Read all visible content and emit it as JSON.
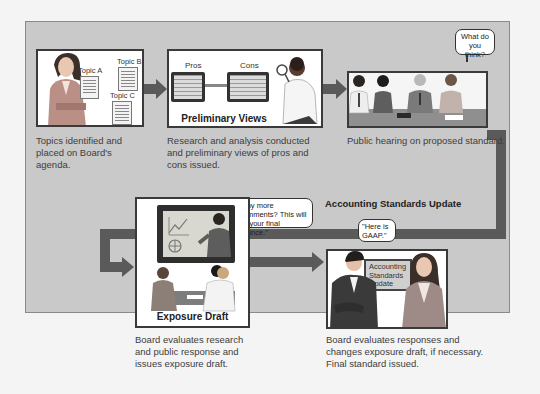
{
  "diagram": {
    "type": "process-flow",
    "steps": [
      {
        "id": 1,
        "caption": "Topics identified and placed on Board's agenda.",
        "image_labels": [
          "Topic A",
          "Topic B",
          "Topic C"
        ]
      },
      {
        "id": 2,
        "caption": "Research and analysis conducted and preliminary views of pros and cons issued.",
        "image_title": "Preliminary Views",
        "image_labels": [
          "Pros",
          "Cons"
        ]
      },
      {
        "id": 3,
        "caption": "Public hearing on proposed standard.",
        "speech": "What do you think?"
      },
      {
        "id": 4,
        "caption": "Board evaluates research and public response and issues exposure draft.",
        "image_title": "Exposure Draft",
        "speech": "\"Any more comments? This will be your final chance.\""
      },
      {
        "id": 5,
        "caption": "Board evaluates responses and changes exposure draft, if necessary. Final standard issued.",
        "heading": "Accounting Standards Update",
        "speech": "\"Here is GAAP.\"",
        "sign": "Accounting Standards Update"
      }
    ]
  },
  "colors": {
    "panel": "#c9c9c9",
    "arrow": "#5a5a5a",
    "box_border": "#3a3a3a"
  }
}
